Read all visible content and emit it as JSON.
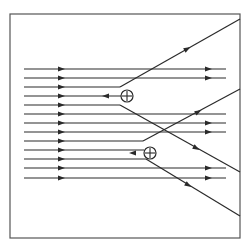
{
  "diagram": {
    "frame": {
      "x": 10,
      "y": 14,
      "w": 230,
      "h": 224
    },
    "colors": {
      "stroke": "#2a2a2a",
      "background": "#ffffff"
    },
    "parallel_lines_y": [
      69,
      78,
      87,
      105,
      114,
      123,
      132,
      141,
      159,
      168,
      178
    ],
    "line_start_x": 24,
    "line_end_x": 226,
    "arrow_x": 61,
    "right_arrow_x": 208,
    "charges": [
      {
        "label": "+",
        "cx": 127,
        "cy": 96,
        "r": 6,
        "incoming_from_x": 104
      },
      {
        "label": "+",
        "cx": 150,
        "cy": 153,
        "r": 6,
        "incoming_from_x": 127
      }
    ]
  }
}
